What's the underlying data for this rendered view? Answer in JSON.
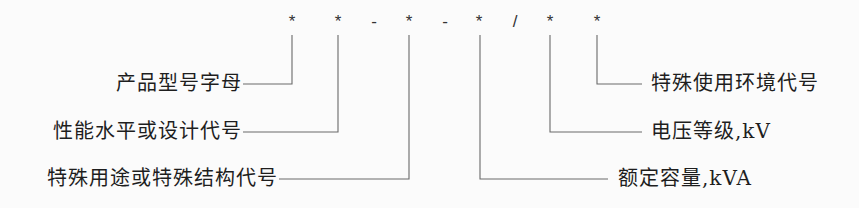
{
  "diagram": {
    "code_symbols": [
      {
        "id": "s1",
        "char": "*",
        "x": 292
      },
      {
        "id": "s2",
        "char": "*",
        "x": 338
      },
      {
        "id": "d1",
        "char": "-",
        "x": 374
      },
      {
        "id": "s3",
        "char": "*",
        "x": 409
      },
      {
        "id": "d2",
        "char": "-",
        "x": 445
      },
      {
        "id": "s4",
        "char": "*",
        "x": 479
      },
      {
        "id": "sl",
        "char": "/",
        "x": 515
      },
      {
        "id": "s5",
        "char": "*",
        "x": 550
      },
      {
        "id": "s6",
        "char": "*",
        "x": 597
      }
    ],
    "left_labels": [
      {
        "text": "产品型号字母",
        "points_to": "s1"
      },
      {
        "text": "性能水平或设计代号",
        "points_to": "s2"
      },
      {
        "text": "特殊用途或特殊结构代号",
        "points_to": "s3"
      }
    ],
    "right_labels": [
      {
        "text": "特殊使用环境代号",
        "points_to": "s6"
      },
      {
        "text": "电压等级,kV",
        "points_to": "s5"
      },
      {
        "text": "额定容量,kVA",
        "points_to": "s4"
      }
    ],
    "line_color": "#6a6a6a",
    "text_color": "#1e1e1e"
  }
}
